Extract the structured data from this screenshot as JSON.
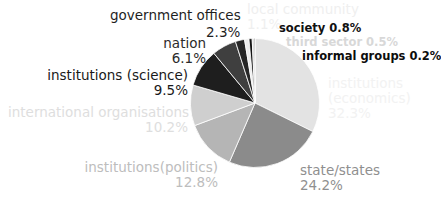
{
  "chart_data": {
    "type": "pie",
    "title": "",
    "subtitle": "",
    "xlabel": "",
    "ylabel": "",
    "legend_position": "none",
    "grid": false,
    "units": "percent",
    "start_angle_deg": 0,
    "direction": "clockwise",
    "categories": [
      "institutions (economics)",
      "state/states",
      "institutions(politics)",
      "international organisations",
      "institutions (science)",
      "nation",
      "government offices",
      "local community",
      "society",
      "third sector",
      "informal groups"
    ],
    "values": [
      32.3,
      24.2,
      12.8,
      10.2,
      9.5,
      6.1,
      2.3,
      1.1,
      0.8,
      0.5,
      0.2
    ],
    "slices": [
      {
        "label": "institutions (economics)",
        "value": 32.3,
        "value_text": "32.3%",
        "color": "#e3e3e3"
      },
      {
        "label": "state/states",
        "value": 24.2,
        "value_text": "24.2%",
        "color": "#8b8b8b"
      },
      {
        "label": "institutions(politics)",
        "value": 12.8,
        "value_text": "12.8%",
        "color": "#b5b5b5"
      },
      {
        "label": "international organisations",
        "value": 10.2,
        "value_text": "10.2%",
        "color": "#cfcfcf"
      },
      {
        "label": "institutions (science)",
        "value": 9.5,
        "value_text": "9.5%",
        "color": "#1e1e1e"
      },
      {
        "label": "nation",
        "value": 6.1,
        "value_text": "6.1%",
        "color": "#3f3f3f"
      },
      {
        "label": "government offices",
        "value": 2.3,
        "value_text": "2.3%",
        "color": "#262626"
      },
      {
        "label": "local community",
        "value": 1.1,
        "value_text": "1.1%",
        "color": "#ededed"
      },
      {
        "label": "society",
        "value": 0.8,
        "value_text": "0.8%",
        "color": "#151515"
      },
      {
        "label": "third sector",
        "value": 0.5,
        "value_text": "0.5%",
        "color": "#d2d2d2"
      },
      {
        "label": "informal groups",
        "value": 0.2,
        "value_text": "0.2%",
        "color": "#0d0d0d"
      }
    ]
  },
  "labels": {
    "economics": {
      "line1": "institutions",
      "line2": "(economics)",
      "line3": "32.3%"
    },
    "state": {
      "line1": "state/states",
      "line2": "24.2%"
    },
    "politics": {
      "line1": "institutions(politics)",
      "line2": "12.8%"
    },
    "intorg": {
      "line1": "international organisations",
      "line2": "10.2%"
    },
    "science": {
      "line1": "institutions (science)",
      "line2": "9.5%"
    },
    "nation": {
      "line1": "nation",
      "line2": "6.1%"
    },
    "government": {
      "name": "government offices",
      "pct": "2.3%"
    },
    "local": {
      "line1": "local community",
      "line2": "1.1%"
    },
    "society": {
      "text": "society 0.8%"
    },
    "third_sector": {
      "text": "third sector 0.5%"
    },
    "informal": {
      "text": "informal groups 0.2%"
    }
  }
}
